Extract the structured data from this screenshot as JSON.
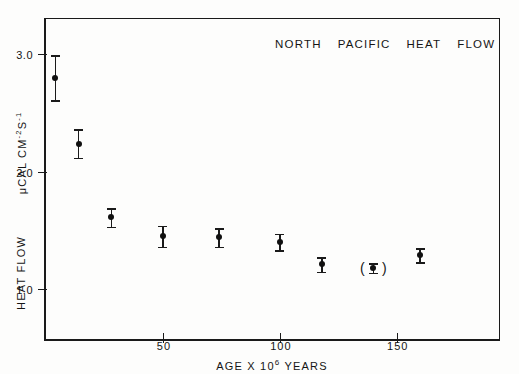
{
  "figure": {
    "title_words": [
      "NORTH",
      "PACIFIC",
      "HEAT",
      "FLOW"
    ],
    "background_color": "#fdfdfc",
    "ink_color": "#1a1a1a"
  },
  "axes": {
    "y": {
      "label_units": "μCAL CM",
      "label_units_sup1": "-2",
      "label_units_mid": "S",
      "label_units_sup2": "-1",
      "label_name": "HEAT  FLOW",
      "ticks": [
        "1.0",
        "2.0",
        "3.0"
      ],
      "tick_values": [
        1.0,
        2.0,
        3.0
      ],
      "range": [
        0.55,
        3.3
      ]
    },
    "x": {
      "label_pre": "AGE  X  10",
      "label_sup": "6",
      "label_post": " YEARS",
      "label": "AGE X 10^6 YEARS",
      "ticks": [
        "50",
        "100",
        "150"
      ],
      "tick_values": [
        50,
        100,
        150
      ],
      "range": [
        0,
        195
      ]
    }
  },
  "chart_data": {
    "type": "scatter",
    "xlabel": "AGE X 10^6 YEARS",
    "ylabel": "HEAT FLOW  μCAL CM^-2 S^-1",
    "xlim": [
      0,
      195
    ],
    "ylim": [
      0.55,
      3.3
    ],
    "grid": false,
    "legend": null,
    "errorbars": true,
    "series": [
      {
        "name": "North Pacific heat flow means",
        "x": [
          4,
          14,
          28,
          50,
          74,
          100,
          118,
          140,
          160
        ],
        "y": [
          2.8,
          2.24,
          1.61,
          1.45,
          1.44,
          1.4,
          1.21,
          1.18,
          1.29
        ],
        "yerr": [
          0.19,
          0.12,
          0.08,
          0.09,
          0.08,
          0.07,
          0.06,
          0.04,
          0.06
        ],
        "parenthesized_index": 7
      }
    ]
  }
}
